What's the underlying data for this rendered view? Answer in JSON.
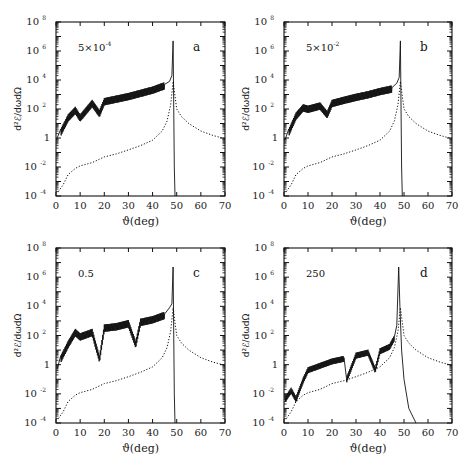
{
  "figure": {
    "x_axis_title": "ϑ(deg)",
    "y_axis_title": "d²ℰ/dωdΩ",
    "x_ticks": [
      "0",
      "10",
      "20",
      "30",
      "40",
      "50",
      "60",
      "70"
    ],
    "y_ticks": [
      {
        "base": "10",
        "exp": "-4"
      },
      {
        "base": "10",
        "exp": "-2"
      },
      {
        "base": "1",
        "exp": ""
      },
      {
        "base": "10",
        "exp": "2"
      },
      {
        "base": "10",
        "exp": "4"
      },
      {
        "base": "10",
        "exp": "6"
      },
      {
        "base": "10",
        "exp": "8"
      }
    ],
    "panels": [
      {
        "letter": "a",
        "param_base": "5×10",
        "param_exp": "-4"
      },
      {
        "letter": "b",
        "param_base": "5×10",
        "param_exp": "-2"
      },
      {
        "letter": "c",
        "param_base": "0.5",
        "param_exp": ""
      },
      {
        "letter": "d",
        "param_base": "250",
        "param_exp": ""
      }
    ]
  },
  "chart_data": [
    {
      "type": "line",
      "panel": "a",
      "title": "5×10^-4",
      "xlabel": "ϑ(deg)",
      "ylabel": "d²ℰ/dωdΩ",
      "xlim": [
        0,
        70
      ],
      "ylim": [
        0.0001,
        100000000.0
      ],
      "yscale": "log",
      "series": [
        {
          "name": "solid (oscillatory)",
          "style": "solid",
          "x": [
            0.5,
            2,
            5,
            8,
            10,
            15,
            18,
            20,
            25,
            30,
            35,
            40,
            45,
            47,
            48,
            48.5,
            49,
            49.3
          ],
          "y": [
            1,
            3,
            30,
            100,
            30,
            300,
            60,
            400,
            600,
            900,
            1500,
            2500,
            5000,
            8000,
            20000,
            5000000.0,
            0.01,
            0.0001
          ]
        },
        {
          "name": "dotted (envelope)",
          "style": "dotted",
          "x": [
            1,
            3,
            5,
            8,
            10,
            15,
            20,
            25,
            30,
            35,
            40,
            44,
            46,
            47.5,
            48.5,
            50,
            52,
            55,
            60,
            65,
            70
          ],
          "y": [
            0.0002,
            0.0006,
            0.003,
            0.008,
            0.012,
            0.02,
            0.05,
            0.08,
            0.15,
            0.3,
            0.7,
            3,
            15,
            200,
            8000,
            100,
            30,
            10,
            3,
            1.5,
            0.9
          ]
        }
      ]
    },
    {
      "type": "line",
      "panel": "b",
      "title": "5×10^-2",
      "xlabel": "ϑ(deg)",
      "ylabel": "d²ℰ/dωdΩ",
      "xlim": [
        0,
        70
      ],
      "ylim": [
        0.0001,
        100000000.0
      ],
      "yscale": "log",
      "series": [
        {
          "name": "solid (oscillatory)",
          "style": "solid",
          "x": [
            0.5,
            2,
            5,
            8,
            10,
            15,
            18,
            20,
            25,
            30,
            35,
            40,
            45,
            47,
            48,
            48.5,
            49,
            49.3
          ],
          "y": [
            0.8,
            3,
            40,
            150,
            120,
            200,
            50,
            300,
            500,
            800,
            1200,
            2000,
            3000,
            6000,
            15000,
            5000000.0,
            0.01,
            0.0001
          ]
        },
        {
          "name": "dotted (envelope)",
          "style": "dotted",
          "x": [
            1,
            3,
            5,
            8,
            10,
            15,
            20,
            25,
            30,
            35,
            40,
            44,
            46,
            47.5,
            48.5,
            50,
            52,
            55,
            60,
            65,
            70
          ],
          "y": [
            0.0002,
            0.0006,
            0.003,
            0.008,
            0.012,
            0.02,
            0.05,
            0.08,
            0.15,
            0.3,
            0.7,
            3,
            15,
            200,
            8000,
            100,
            30,
            10,
            3,
            1.5,
            0.9
          ]
        }
      ]
    },
    {
      "type": "line",
      "panel": "c",
      "title": "0.5",
      "xlabel": "ϑ(deg)",
      "ylabel": "d²ℰ/dωdΩ",
      "xlim": [
        0,
        70
      ],
      "ylim": [
        0.0001,
        100000000.0
      ],
      "yscale": "log",
      "series": [
        {
          "name": "solid (oscillatory)",
          "style": "solid",
          "x": [
            0.5,
            2,
            5,
            8,
            10,
            15,
            18,
            20,
            25,
            30,
            33,
            35,
            40,
            45,
            47,
            48,
            48.5,
            49,
            49.3
          ],
          "y": [
            0.5,
            3,
            30,
            200,
            100,
            200,
            3,
            400,
            500,
            800,
            30,
            1000,
            1500,
            3000,
            8000,
            15000,
            5000000.0,
            0.01,
            0.0001
          ]
        },
        {
          "name": "dotted (envelope)",
          "style": "dotted",
          "x": [
            1,
            3,
            5,
            8,
            10,
            15,
            20,
            25,
            30,
            35,
            40,
            44,
            46,
            47.5,
            48.5,
            50,
            52,
            55,
            60,
            65,
            70
          ],
          "y": [
            0.0002,
            0.0006,
            0.003,
            0.008,
            0.012,
            0.02,
            0.05,
            0.08,
            0.15,
            0.3,
            0.7,
            3,
            15,
            200,
            8000,
            100,
            30,
            10,
            3,
            1.5,
            0.9
          ]
        }
      ]
    },
    {
      "type": "line",
      "panel": "d",
      "title": "250",
      "xlabel": "ϑ(deg)",
      "ylabel": "d²ℰ/dωdΩ",
      "xlim": [
        0,
        70
      ],
      "ylim": [
        0.0001,
        100000000.0
      ],
      "yscale": "log",
      "series": [
        {
          "name": "solid (oscillatory)",
          "style": "solid",
          "x": [
            0.5,
            3,
            5,
            8,
            10,
            15,
            20,
            25,
            26,
            30,
            35,
            38,
            40,
            44,
            46,
            47,
            47.8,
            48.3,
            49,
            50,
            52,
            55
          ],
          "y": [
            0.005,
            0.02,
            0.005,
            0.1,
            0.5,
            1,
            2,
            3,
            0.1,
            5,
            8,
            0.5,
            10,
            20,
            80,
            500,
            5000000.0,
            10000.0,
            10,
            0.1,
            0.001,
            0.0001
          ]
        },
        {
          "name": "dotted (envelope)",
          "style": "dotted",
          "x": [
            1,
            3,
            5,
            8,
            10,
            15,
            20,
            25,
            30,
            35,
            40,
            44,
            46,
            47.5,
            48.5,
            50,
            52,
            55,
            60,
            65,
            70
          ],
          "y": [
            0.0002,
            0.0006,
            0.003,
            0.008,
            0.012,
            0.02,
            0.05,
            0.08,
            0.15,
            0.3,
            0.7,
            3,
            15,
            200,
            8000,
            100,
            30,
            10,
            3,
            1.5,
            0.9
          ]
        }
      ]
    }
  ]
}
